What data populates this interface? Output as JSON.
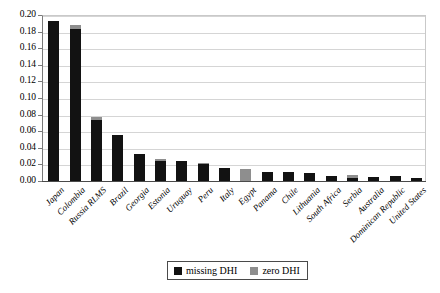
{
  "chart_data": {
    "type": "bar",
    "title": "",
    "subtitle": "",
    "xlabel": "",
    "ylabel": "",
    "ylim": [
      0.0,
      0.2
    ],
    "ytick_labels": [
      "0.20",
      "0.18",
      "0.16",
      "0.14",
      "0.12",
      "0.10",
      "0.08",
      "0.06",
      "0.04",
      "0.02",
      "0.00"
    ],
    "ytick_values": [
      0.2,
      0.18,
      0.16,
      0.14,
      0.12,
      0.1,
      0.08,
      0.06,
      0.04,
      0.02,
      0.0
    ],
    "grid": true,
    "stacked": true,
    "legend_position": "bottom-center",
    "categories": [
      "Japan",
      "Colombia",
      "Russia RLMS",
      "Brazil",
      "Georgia",
      "Estonia",
      "Uruguay",
      "Peru",
      "Italy",
      "Egypt",
      "Panama",
      "Chile",
      "Lithuania",
      "South Africa",
      "Serbia",
      "Australia",
      "Dominican Republic",
      "United States"
    ],
    "series": [
      {
        "name": "missing DHI",
        "color": "#121212",
        "values": [
          0.193,
          0.183,
          0.073,
          0.055,
          0.033,
          0.024,
          0.024,
          0.02,
          0.016,
          0.0,
          0.011,
          0.011,
          0.01,
          0.006,
          0.004,
          0.005,
          0.006,
          0.004
        ]
      },
      {
        "name": "zero DHI",
        "color": "#8e8e8e",
        "values": [
          0.0,
          0.005,
          0.004,
          0.0,
          0.0,
          0.002,
          0.0,
          0.002,
          0.0,
          0.015,
          0.0,
          0.0,
          0.0,
          0.0,
          0.003,
          0.0,
          0.0,
          0.0
        ]
      }
    ],
    "totals": [
      0.193,
      0.188,
      0.077,
      0.055,
      0.033,
      0.026,
      0.024,
      0.022,
      0.016,
      0.015,
      0.011,
      0.011,
      0.01,
      0.006,
      0.007,
      0.005,
      0.006,
      0.004
    ]
  },
  "legend": {
    "entries": [
      {
        "label": "missing DHI",
        "color": "#121212"
      },
      {
        "label": "zero DHI",
        "color": "#8e8e8e"
      }
    ]
  }
}
